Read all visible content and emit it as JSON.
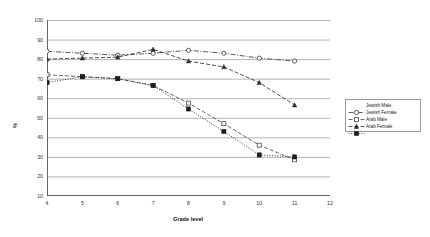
{
  "chart_data": {
    "type": "line",
    "title": "",
    "xlabel": "Grade level",
    "ylabel": "%",
    "xlim": [
      4,
      12
    ],
    "ylim": [
      10,
      100
    ],
    "xticks": [
      "4",
      "5",
      "6",
      "7",
      "8",
      "9",
      "10",
      "11",
      "12"
    ],
    "yticks": [
      "10",
      "20",
      "30",
      "40",
      "50",
      "60",
      "70",
      "80",
      "90",
      "100"
    ],
    "grid": true,
    "legend_position": "right",
    "x": [
      4,
      5,
      6,
      7,
      8,
      9,
      10,
      11
    ],
    "series": [
      {
        "name": "Jewish Male",
        "marker": "open-circle",
        "line": "dash-dot",
        "color": "#3a3a3a",
        "values": [
          84,
          83,
          82,
          83,
          84.5,
          83,
          80.5,
          79
        ]
      },
      {
        "name": "Jewish Female",
        "marker": "open-square",
        "line": "dash",
        "color": "#4a4a4a",
        "values": [
          72,
          71,
          70,
          66.5,
          57.5,
          47,
          36,
          28.5
        ]
      },
      {
        "name": "Arab Male",
        "marker": "filled-triangle",
        "line": "dash",
        "color": "#2e2e2e",
        "values": [
          80,
          80.5,
          81,
          85,
          79,
          76,
          68,
          56.5
        ]
      },
      {
        "name": "Arab Female",
        "marker": "filled-square",
        "line": "dot",
        "color": "#1c1c1c",
        "values": [
          68,
          71,
          70,
          66.5,
          54.5,
          43,
          31,
          30
        ]
      }
    ]
  },
  "legend": {
    "items": [
      {
        "label": "Jewish Male"
      },
      {
        "label": "Jewish Female"
      },
      {
        "label": "Arab Male"
      },
      {
        "label": "Arab Female"
      }
    ]
  }
}
